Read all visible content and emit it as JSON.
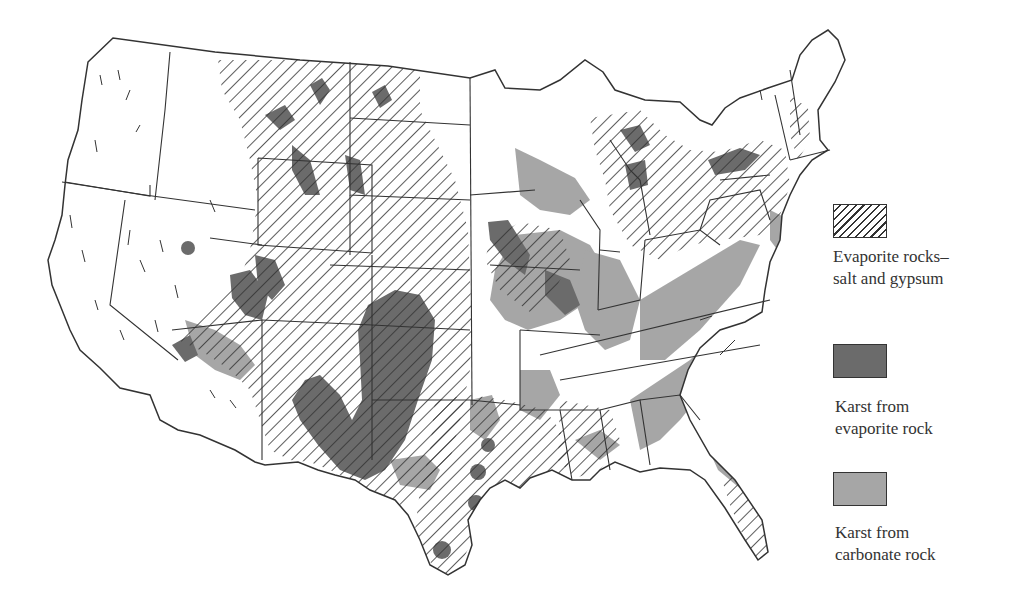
{
  "map": {
    "title": "Karst and evaporite rock regions of the conterminous United States",
    "region": "Conterminous United States",
    "colors": {
      "outline": "#333333",
      "evaporite_hatch": "#333333",
      "karst_evaporite": "#6b6b6b",
      "karst_carbonate": "#a6a6a6",
      "background": "#ffffff"
    }
  },
  "legend": {
    "items": [
      {
        "key": "evaporite",
        "label_line1": "Evaporite rocks–",
        "label_line2": "salt and gypsum",
        "swatch": "hatch",
        "color": "#333333"
      },
      {
        "key": "karst_evaporite",
        "label_line1": "Karst from",
        "label_line2": "evaporite rock",
        "swatch": "solid",
        "color": "#6b6b6b"
      },
      {
        "key": "karst_carbonate",
        "label_line1": "Karst from",
        "label_line2": "carbonate rock",
        "swatch": "solid",
        "color": "#a6a6a6"
      }
    ]
  }
}
